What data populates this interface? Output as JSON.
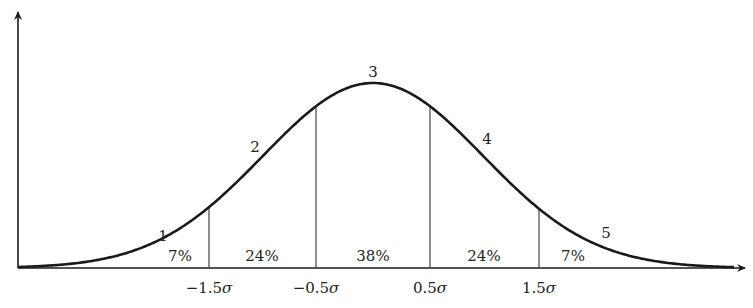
{
  "diagram": {
    "type": "normal-distribution-curve",
    "mean_px": 373,
    "sigma_px": 110,
    "baseline_y": 268,
    "peak_height_px": 185,
    "colors": {
      "stroke": "#1a1a1a",
      "grid": "#444444",
      "text": "#222222"
    },
    "curve_labels": [
      {
        "text": "1",
        "x": 163,
        "y": 241
      },
      {
        "text": "2",
        "x": 255,
        "y": 152
      },
      {
        "text": "3",
        "x": 373,
        "y": 77
      },
      {
        "text": "4",
        "x": 487,
        "y": 144
      },
      {
        "text": "5",
        "x": 606,
        "y": 238
      }
    ],
    "region_percentages": [
      {
        "text": "7%",
        "x": 180,
        "y": 261
      },
      {
        "text": "24%",
        "x": 262,
        "y": 261
      },
      {
        "text": "38%",
        "x": 373,
        "y": 261
      },
      {
        "text": "24%",
        "x": 484,
        "y": 261
      },
      {
        "text": "7%",
        "x": 573,
        "y": 261
      }
    ],
    "dividers": [
      {
        "sigma": -1.5,
        "x": 209,
        "label_num": "−1.5",
        "label_sym": "σ"
      },
      {
        "sigma": -0.5,
        "x": 316,
        "label_num": "−0.5",
        "label_sym": "σ"
      },
      {
        "sigma": 0.5,
        "x": 430,
        "label_num": "0.5",
        "label_sym": "σ"
      },
      {
        "sigma": 1.5,
        "x": 539,
        "label_num": "1.5",
        "label_sym": "σ"
      }
    ]
  }
}
